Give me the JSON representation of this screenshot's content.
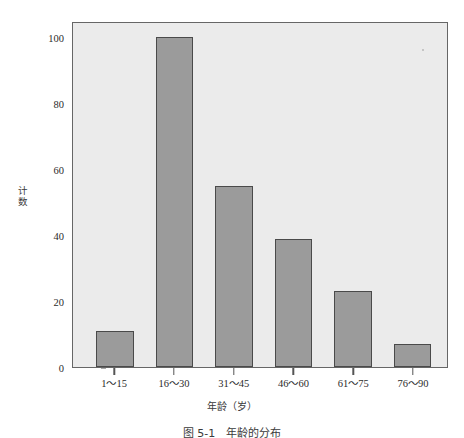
{
  "chart_data": {
    "type": "bar",
    "title": "",
    "subtitle": "",
    "xlabel": "年龄（岁）",
    "ylabel": "计数",
    "categories": [
      "1～15",
      "16～30",
      "31～45",
      "46～60",
      "61～75",
      "76～90"
    ],
    "values": [
      11,
      100,
      55,
      39,
      23,
      7
    ],
    "ylim": [
      0,
      105
    ],
    "yticks": [
      0,
      20,
      40,
      60,
      80,
      100
    ],
    "ytick_labels": [
      "0",
      "20",
      "40",
      "60",
      "80",
      "100"
    ],
    "grid": false,
    "legend": null,
    "bar_fill_color": "#9b9b9b",
    "bar_edge_color": "#4a4a4a",
    "plot_background_color": "#ebebeb",
    "axis_color": "#666666"
  },
  "caption": {
    "text": "图 5-1　年龄的分布"
  }
}
